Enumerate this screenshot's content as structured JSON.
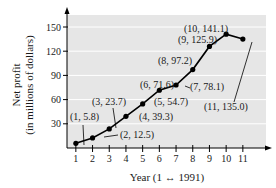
{
  "chart_data": {
    "type": "line",
    "title": "",
    "xlabel": "Year (1 ↔ 1991)",
    "ylabel_line1": "Net profit",
    "ylabel_line2": "(in millions of dollars)",
    "x": [
      1,
      2,
      3,
      4,
      5,
      6,
      7,
      8,
      9,
      10,
      11
    ],
    "values": [
      5.8,
      12.5,
      23.7,
      39.3,
      54.7,
      71.6,
      78.1,
      97.2,
      125.9,
      141.1,
      135.0
    ],
    "xticks": [
      "1",
      "2",
      "3",
      "4",
      "5",
      "6",
      "7",
      "8",
      "9",
      "10",
      "11"
    ],
    "yticks": [
      "30",
      "60",
      "90",
      "120",
      "150"
    ],
    "ylim": [
      0,
      165
    ],
    "xlim": [
      0.5,
      11.5
    ],
    "grid": true,
    "legend": null,
    "annotations": [
      "(1, 5.8)",
      "(2, 12.5)",
      "(3, 23.7)",
      "(4, 39.3)",
      "(5, 54.7)",
      "(6, 71.6)",
      "(7, 78.1)",
      "(8, 97.2)",
      "(9, 125.9)",
      "(10, 141.1)",
      "(11, 135.0)"
    ]
  },
  "colors": {
    "plot_bg": "#e6e6e6",
    "grid": "#ffffff",
    "line": "#000000"
  }
}
